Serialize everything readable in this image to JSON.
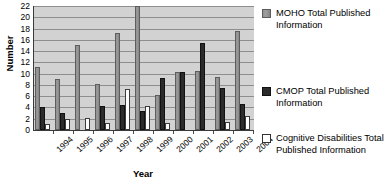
{
  "chart_data": {
    "type": "bar",
    "title": "",
    "xlabel": "Year",
    "ylabel": "Number",
    "categories": [
      "1994",
      "1995",
      "1996",
      "1997",
      "1998",
      "1999",
      "2000",
      "2001",
      "2002",
      "2003",
      "2004"
    ],
    "ylim": [
      0,
      22
    ],
    "ytick_step": 2,
    "yticks": [
      "0",
      "2",
      "4",
      "6",
      "8",
      "10",
      "12",
      "14",
      "16",
      "18",
      "20",
      "22"
    ],
    "grid": true,
    "legend_position": "right",
    "series": [
      {
        "name": "MOHO Total Published Information",
        "color": "#949494",
        "values": [
          11.1,
          9.0,
          15.1,
          8.2,
          17.2,
          22.0,
          6.3,
          10.3,
          10.4,
          9.4,
          17.5
        ]
      },
      {
        "name": "CMOP Total Published Information",
        "color": "#2b2b2b",
        "values": [
          4.1,
          3.1,
          0.0,
          4.3,
          4.4,
          3.3,
          9.3,
          10.3,
          15.4,
          7.5,
          4.6
        ]
      },
      {
        "name": "Cognitive Disabilities Total Published Information",
        "color": "#ffffff",
        "values": [
          1.1,
          2.0,
          2.1,
          1.2,
          7.2,
          4.3,
          1.3,
          0.0,
          0.0,
          1.5,
          2.5
        ]
      }
    ]
  },
  "legend": {
    "entries": [
      {
        "label": "MOHO Total Published Information",
        "swatch": "moho"
      },
      {
        "label": "CMOP Total Published Information",
        "swatch": "cmop"
      },
      {
        "label": "Cognitive Disabilities Total Published Information",
        "swatch": "cog"
      }
    ]
  }
}
